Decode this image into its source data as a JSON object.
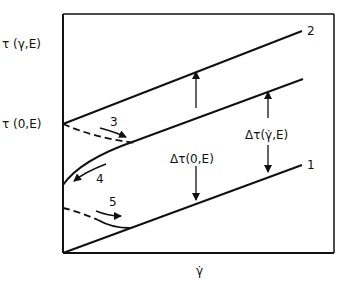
{
  "axes": {
    "y_label_top": "τ (γ,E)",
    "y_label_mid": "τ (0,E)",
    "x_label": "γ̇"
  },
  "curves": [
    {
      "id": "2",
      "label": "2"
    },
    {
      "id": "1",
      "label": "1"
    },
    {
      "id": "3",
      "label": "3"
    },
    {
      "id": "4",
      "label": "4"
    },
    {
      "id": "5",
      "label": "5"
    }
  ],
  "annotations": {
    "delta_zero": "Δτ(0,E)",
    "delta_rate": "Δτ(γ̇,E)"
  },
  "colors": {
    "stroke": "#111111",
    "background": "#ffffff"
  }
}
